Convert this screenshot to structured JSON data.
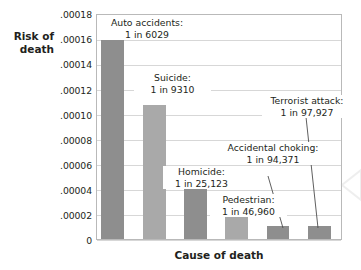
{
  "chart_data": {
    "type": "bar",
    "title": "",
    "xlabel": "Cause of death",
    "ylabel": "Risk of\ndeath",
    "categories": [
      "Auto accidents",
      "Suicide",
      "Homicide",
      "Pedestrian",
      "Accidental choking",
      "Terrorist attack"
    ],
    "values": [
      0.00016586,
      0.00010741,
      3.98e-05,
      2.129e-05,
      1.06e-05,
      1.021e-05
    ],
    "odds_text": [
      "1 in 6029",
      "1 in 9310",
      "1 in 25,123",
      "1 in 46,960",
      "1 in 94,371",
      "1 in 97,927"
    ],
    "point_labels": [
      "Auto accidents:\n1 in 6029",
      "Suicide:\n1 in 9310",
      "Homicide:\n1 in 25,123",
      "Pedestrian:\n1 in 46,960",
      "Accidental choking:\n1 in 94,371",
      "Terrorist attack:\n1 in 97,927"
    ],
    "ylim": [
      0,
      0.00018
    ],
    "ytick_values": [
      0.00018,
      0.00016,
      0.00014,
      0.00012,
      0.0001,
      8e-05,
      6e-05,
      4e-05,
      2e-05,
      0
    ],
    "ytick_labels": [
      ".00018",
      ".00016",
      ".00014",
      ".00012",
      ".00010",
      ".00008",
      ".00006",
      ".00004",
      ".00002",
      "0"
    ],
    "xtick_labels": [],
    "grid": true,
    "legend": "none",
    "bar_colors": [
      "#8e8e8e",
      "#a9a9a9",
      "#8e8e8e",
      "#a9a9a9",
      "#8e8e8e",
      "#8e8e8e"
    ]
  },
  "axes": {
    "ylabel_text": "Risk of\ndeath",
    "xlabel_text": "Cause of death"
  },
  "labels": {
    "auto": "Auto accidents:\n1 in 6029",
    "suicide": "Suicide:\n1 in 9310",
    "homicide": "Homicide:\n1 in 25,123",
    "pedestrian": "Pedestrian:\n1 in 46,960",
    "choking": "Accidental choking:\n1 in 94,371",
    "terrorist": "Terrorist attack:\n1 in 97,927"
  },
  "ytick_labels": {
    "t0": ".00018",
    "t1": ".00016",
    "t2": ".00014",
    "t3": ".00012",
    "t4": ".00010",
    "t5": ".00008",
    "t6": ".00006",
    "t7": ".00004",
    "t8": ".00002",
    "t9": "0"
  }
}
